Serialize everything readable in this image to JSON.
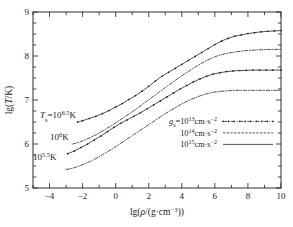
{
  "figure": {
    "background": "#ffffff",
    "ink": "#1a1a1a"
  },
  "axes": {
    "x": {
      "label_parts": {
        "lg": "lg(",
        "rho": "ρ",
        "mid": "/(g·cm",
        "exp": "−3",
        "close": "))"
      },
      "label_plain": "lg(ρ/(g·cm−3))",
      "min": -5,
      "max": 10,
      "tick_labels": [
        "−4",
        "−2",
        "0",
        "2",
        "4",
        "6",
        "8",
        "10"
      ],
      "tick_values": [
        -4,
        -2,
        0,
        2,
        4,
        6,
        8,
        10
      ],
      "minor_step": 1
    },
    "y": {
      "label_parts": {
        "lg": "lg(",
        "T": "T",
        "close": "/K)"
      },
      "label_plain": "lg(T/K)",
      "min": 5,
      "max": 9,
      "tick_labels": [
        "5",
        "6",
        "7",
        "8",
        "9"
      ],
      "tick_values": [
        5,
        6,
        7,
        8,
        9
      ],
      "minor_step": 0.25
    }
  },
  "annotations": [
    {
      "name": "ts-label-65",
      "prefix": "T",
      "sub": "s",
      "eq": "=10",
      "sup": "6.5",
      "unit": "K",
      "x_px": 40,
      "y_px": 118
    },
    {
      "name": "ts-label-6",
      "prefix": "",
      "sub": "",
      "eq": "10",
      "sup": "6",
      "unit": "K",
      "x_px": 50,
      "y_px": 140
    },
    {
      "name": "ts-label-55",
      "prefix": "",
      "sub": "",
      "eq": "10",
      "sup": "5.5",
      "unit": "K",
      "x_px": 33,
      "y_px": 160
    }
  ],
  "legend": {
    "title_symbol": "g",
    "title_sub": "s",
    "title_eq": "=",
    "x_px": 163,
    "y_px": 124,
    "entries": [
      {
        "name": "legend-g13",
        "mantissa": "10",
        "exponent": "13",
        "unit": "cm·s",
        "unit_exp": "−2",
        "style": "dashdot-dot"
      },
      {
        "name": "legend-g14",
        "mantissa": "10",
        "exponent": "14",
        "unit": "cm·s",
        "unit_exp": "−2",
        "style": "dotted-dash"
      },
      {
        "name": "legend-g15",
        "mantissa": "10",
        "exponent": "15",
        "unit": "cm·s",
        "unit_exp": "−2",
        "style": "solid"
      }
    ]
  },
  "chart_data": {
    "type": "line",
    "title": "",
    "xlabel": "lg(ρ/(g·cm−3))",
    "ylabel": "lg(T/K)",
    "xlim": [
      -5,
      10
    ],
    "ylim": [
      5,
      9
    ],
    "grid": false,
    "legend_position": "lower-right-inside",
    "series": [
      {
        "name": "Ts=10^6.5 K, gs=10^14 cm s^-2",
        "marker": "dot",
        "style": "dashdot-dot",
        "x": [
          -2.3,
          -2.0,
          -1.6,
          -1.2,
          -0.8,
          -0.4,
          0.0,
          0.4,
          0.8,
          1.2,
          1.6,
          2.0,
          2.4,
          2.8,
          3.2,
          3.6,
          4.0,
          4.4,
          4.8,
          5.2,
          5.6,
          6.0,
          6.4,
          6.8,
          7.2,
          7.6,
          8.0,
          8.4,
          8.8,
          9.2,
          9.6,
          10.0
        ],
        "y": [
          6.5,
          6.53,
          6.58,
          6.63,
          6.69,
          6.76,
          6.84,
          6.92,
          7.01,
          7.1,
          7.2,
          7.31,
          7.43,
          7.54,
          7.63,
          7.72,
          7.81,
          7.9,
          7.99,
          8.08,
          8.17,
          8.26,
          8.34,
          8.4,
          8.45,
          8.48,
          8.51,
          8.53,
          8.55,
          8.56,
          8.57,
          8.58
        ]
      },
      {
        "name": "Ts=10^6 K, gs=10^14 cm s^-2",
        "marker": "none",
        "style": "dotted-dash",
        "x": [
          -2.6,
          -2.2,
          -1.8,
          -1.4,
          -1.0,
          -0.6,
          -0.2,
          0.2,
          0.6,
          1.0,
          1.4,
          1.8,
          2.2,
          2.6,
          3.0,
          3.4,
          3.8,
          4.2,
          4.6,
          5.0,
          5.4,
          5.8,
          6.2,
          6.6,
          7.0,
          7.4,
          7.8,
          8.2,
          8.6,
          9.0,
          9.4,
          10.0
        ],
        "y": [
          6.0,
          6.04,
          6.1,
          6.17,
          6.25,
          6.34,
          6.43,
          6.53,
          6.63,
          6.73,
          6.84,
          6.95,
          7.06,
          7.17,
          7.28,
          7.39,
          7.5,
          7.6,
          7.7,
          7.79,
          7.88,
          7.95,
          8.01,
          8.05,
          8.08,
          8.1,
          8.12,
          8.13,
          8.14,
          8.145,
          8.15,
          8.15
        ]
      },
      {
        "name": "Ts=10^6 K, gs=10^15 cm s^-2",
        "marker": "dot",
        "style": "solid-dot",
        "x": [
          -2.9,
          -2.5,
          -2.1,
          -1.7,
          -1.3,
          -0.9,
          -0.5,
          -0.1,
          0.3,
          0.7,
          1.1,
          1.5,
          1.9,
          2.3,
          2.7,
          3.1,
          3.5,
          3.9,
          4.3,
          4.7,
          5.1,
          5.5,
          5.9,
          6.3,
          6.7,
          7.1,
          7.5,
          7.9,
          8.3,
          8.7,
          9.1,
          9.5,
          10.0
        ],
        "y": [
          5.78,
          5.84,
          5.92,
          6.0,
          6.09,
          6.18,
          6.28,
          6.38,
          6.47,
          6.55,
          6.63,
          6.71,
          6.8,
          6.89,
          6.98,
          7.07,
          7.16,
          7.25,
          7.33,
          7.41,
          7.48,
          7.54,
          7.59,
          7.62,
          7.645,
          7.66,
          7.67,
          7.675,
          7.68,
          7.68,
          7.68,
          7.68,
          7.68
        ]
      },
      {
        "name": "Ts=10^5.5 K, gs=10^15 cm s^-2",
        "marker": "none",
        "style": "dotted-dash",
        "x": [
          -3.0,
          -2.6,
          -2.2,
          -1.8,
          -1.4,
          -1.0,
          -0.6,
          -0.2,
          0.2,
          0.6,
          1.0,
          1.4,
          1.8,
          2.2,
          2.6,
          3.0,
          3.4,
          3.8,
          4.2,
          4.6,
          5.0,
          5.4,
          5.8,
          6.2,
          6.6,
          7.0,
          7.4,
          7.8,
          8.2,
          8.6,
          9.0,
          9.4,
          10.0
        ],
        "y": [
          5.42,
          5.45,
          5.5,
          5.56,
          5.63,
          5.71,
          5.8,
          5.89,
          5.99,
          6.09,
          6.19,
          6.29,
          6.39,
          6.49,
          6.59,
          6.69,
          6.78,
          6.87,
          6.95,
          7.02,
          7.08,
          7.13,
          7.17,
          7.19,
          7.205,
          7.215,
          7.22,
          7.22,
          7.22,
          7.22,
          7.22,
          7.22,
          7.22
        ]
      }
    ]
  }
}
